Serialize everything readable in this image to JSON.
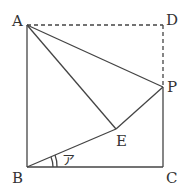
{
  "diagram": {
    "type": "geometry-figure",
    "points": {
      "A": {
        "label": "A",
        "x": 27,
        "y": 25
      },
      "B": {
        "label": "B",
        "x": 27,
        "y": 167
      },
      "C": {
        "label": "C",
        "x": 163,
        "y": 167
      },
      "D": {
        "label": "D",
        "x": 163,
        "y": 25
      },
      "P": {
        "label": "P",
        "x": 163,
        "y": 87
      },
      "E": {
        "label": "E",
        "x": 116,
        "y": 129
      }
    },
    "solid_segments": [
      "AB",
      "BC",
      "CP",
      "AP",
      "AE",
      "PE",
      "BE"
    ],
    "dashed_segments": [
      "AD",
      "DP"
    ],
    "angle_mark": {
      "vertex": "B",
      "between": [
        "BC",
        "BE"
      ],
      "arcs": 2,
      "label": "ア"
    },
    "colors": {
      "line": "#444444",
      "background": "#ffffff"
    }
  }
}
